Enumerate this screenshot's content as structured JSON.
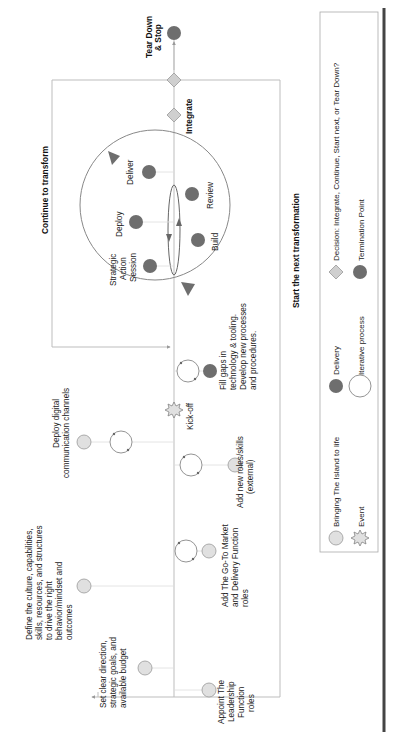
{
  "diagram": {
    "orientation": "rotated-90-ccw",
    "colors": {
      "bringing_fill": "#e0e0e0",
      "delivery_fill": "#6e6e6e",
      "decision_fill": "#cfcfcf",
      "line": "#b5b5b5",
      "dark_line": "#555555"
    },
    "phase_labels": {
      "continue": "Continue to transform",
      "start_next": "Start the next transformation"
    },
    "termination": {
      "label_1": "Tear Down",
      "label_2": "& Stop"
    },
    "decision": {
      "integrate": "Integrate"
    },
    "cycle": {
      "strategic": [
        "Strategic",
        "Action",
        "Session"
      ],
      "deploy": "Deploy",
      "deliver": "Deliver",
      "review": "Review",
      "build": "Build"
    },
    "events": {
      "kickoff": "Kick-off"
    },
    "steps": {
      "deploy_digital": [
        "Deploy digital",
        "communication channels"
      ],
      "fill_gaps": [
        "Fill gaps in",
        "technology & tooling.",
        "Develop new processes",
        "and procedures."
      ],
      "add_roles": [
        "Add new roles/skills",
        "(external)"
      ],
      "define_culture": [
        "Define the culture, capabilities,",
        "skills, resources, and structures",
        "to drive the right",
        "behavior/mindset and",
        "outcomes"
      ],
      "go_to_market": [
        "Add The Go-To Market",
        "and Delivery Function",
        "roles"
      ],
      "set_direction": [
        "Set clear direction,",
        "strategic goals, and",
        "available budget"
      ],
      "appoint": [
        "Appoint The",
        "Leadership",
        "Function",
        "roles"
      ]
    },
    "legend": {
      "bringing": "Bringing The Island to life",
      "delivery": "Delivery",
      "decision": "Decision: Integrate, Continue, Start next, or Tear Down?",
      "event": "Event",
      "iterative": "Iterative process",
      "termination": "Termination Point"
    }
  }
}
